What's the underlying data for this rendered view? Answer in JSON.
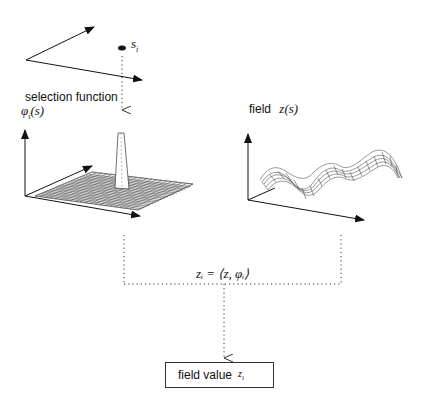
{
  "top_axes": {
    "point_label": "s",
    "point_subscript": "i"
  },
  "selection": {
    "title": "selection function",
    "symbol": "φ",
    "symbol_sub": "i",
    "symbol_arg": "(s)"
  },
  "field": {
    "title": "field",
    "symbol": "z(s)"
  },
  "equation": {
    "text": "zᵢ = ⟨z, φᵢ⟩"
  },
  "result_box": {
    "label": "field value",
    "symbol": "z",
    "symbol_sub": "i"
  },
  "colors": {
    "line": "#111111",
    "dotted": "#333333",
    "background": "#ffffff"
  }
}
